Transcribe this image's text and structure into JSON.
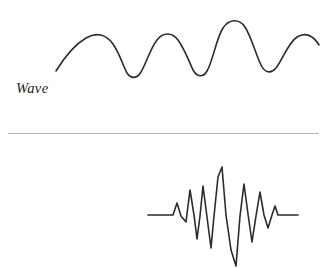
{
  "figure": {
    "background_color": "#ffffff",
    "curve_color": "#2b2b2b",
    "divider_color": "#b8b8b8",
    "width": 331,
    "height": 268
  },
  "panels": [
    {
      "id": "wave",
      "caption": "Wave",
      "description": "Continuous oscillating sinusoidal-like wave with four crests of slowly varying amplitude",
      "path": "M 56,71 C 64,58 74,45 86,38 C 96,32 106,34 113,44 C 120,54 123,66 127,73 C 131,79 137,79 141,72 C 146,64 150,49 157,40 C 163,32 172,32 178,40 C 184,48 189,61 193,70 C 197,77 203,78 207,71 C 213,61 216,39 223,28 C 229,19 239,18 245,27 C 251,36 256,55 261,65 C 265,73 271,74 276,68 C 283,59 288,43 297,37 C 305,32 313,35 319,45"
    },
    {
      "id": "packet",
      "caption": "Wave Packet",
      "description": "Localized wave packet: flat baseline, growing oscillations, tall central spike, then decaying oscillations back to flat baseline",
      "path": "M 148,215 L 173,215 L 177,203 L 181,216 L 186,222 L 190,190 L 194,215 L 197,239 L 200,216 L 203,186 L 207,217 L 211,248 L 214,216 L 218,177 L 222,167 L 226,215 L 231,250 L 236,266 L 240,216 L 244,184 L 248,214 L 252,242 L 256,216 L 260,192 L 264,215 L 268,228 L 272,215 L 275,206 L 278,215 L 298,215"
    }
  ],
  "chart_data": {
    "type": "line",
    "xlabel": "",
    "ylabel": "",
    "series": [
      {
        "name": "Wave",
        "description": "Extended periodic wave, amplitude modulated, four crests visible",
        "crest_positions_px": [
          86,
          157,
          223,
          297
        ],
        "trough_positions_px": [
          127,
          193,
          261
        ],
        "baseline_px": 55,
        "peak_amplitude_px": 28
      },
      {
        "name": "Wave Packet",
        "description": "Spatially localized burst of oscillations centered near the middle, flat on both sides",
        "baseline_y_px": 215,
        "left_flat_start_px": 148,
        "right_flat_end_px": 298,
        "center_peak_x_px": 222,
        "center_peak_y_px": 167,
        "deepest_trough_x_px": 236,
        "deepest_trough_y_px": 266
      }
    ],
    "legend": [
      "Wave",
      "Wave Packet"
    ],
    "legend_position": "inline-left-labels",
    "grid": false
  }
}
